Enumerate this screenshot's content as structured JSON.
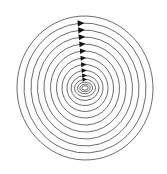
{
  "figure": {
    "name": "phase-portrait-center",
    "title": "Concentric closed orbits with clockwise flow arrows",
    "background_color": "#ffffff",
    "curve_color": "#3b3b3b",
    "arrow_color": "#111111",
    "width": 167,
    "height": 174
  },
  "chart_data": {
    "type": "line",
    "title": "Concentric closed orbits with clockwise flow arrows",
    "subtitle": "",
    "xlabel": "",
    "ylabel": "",
    "xlim": [
      0,
      167
    ],
    "ylim": [
      0,
      174
    ],
    "grid": false,
    "legend": "none",
    "axes_visible": false,
    "tick_labels_x": [],
    "tick_labels_y": [],
    "annotations": [],
    "center": {
      "x": 85,
      "y": 88
    },
    "orbit_count": 14,
    "arrow_count": 11,
    "arrow_direction": "right",
    "rotation_sense": "clockwise",
    "tilt_degrees": -4,
    "series": [
      {
        "name": "orbit-1",
        "rx": 68.0,
        "ry": 72.0,
        "arrow": true,
        "arrow_size": 0.0
      },
      {
        "name": "orbit-2",
        "rx": 61.0,
        "ry": 65.0,
        "arrow": true,
        "arrow_size": 5.0
      },
      {
        "name": "orbit-3",
        "rx": 54.0,
        "ry": 58.0,
        "arrow": true,
        "arrow_size": 5.0
      },
      {
        "name": "orbit-4",
        "rx": 47.5,
        "ry": 51.0,
        "arrow": true,
        "arrow_size": 4.8
      },
      {
        "name": "orbit-5",
        "rx": 41.0,
        "ry": 44.0,
        "arrow": true,
        "arrow_size": 4.6
      },
      {
        "name": "orbit-6",
        "rx": 34.5,
        "ry": 37.0,
        "arrow": true,
        "arrow_size": 4.4
      },
      {
        "name": "orbit-7",
        "rx": 28.5,
        "ry": 30.0,
        "arrow": true,
        "arrow_size": 4.2
      },
      {
        "name": "orbit-8",
        "rx": 23.0,
        "ry": 23.5,
        "arrow": true,
        "arrow_size": 4.0
      },
      {
        "name": "orbit-9",
        "rx": 18.0,
        "ry": 17.5,
        "arrow": true,
        "arrow_size": 3.8
      },
      {
        "name": "orbit-10",
        "rx": 14.0,
        "ry": 12.5,
        "arrow": true,
        "arrow_size": 3.6
      },
      {
        "name": "orbit-11",
        "rx": 10.5,
        "ry": 8.6,
        "arrow": true,
        "arrow_size": 3.4
      },
      {
        "name": "orbit-12",
        "rx": 7.6,
        "ry": 5.8,
        "arrow": false,
        "arrow_size": 0
      },
      {
        "name": "orbit-13",
        "rx": 5.2,
        "ry": 3.8,
        "arrow": false,
        "arrow_size": 0
      },
      {
        "name": "orbit-14",
        "rx": 3.2,
        "ry": 2.2,
        "arrow": false,
        "arrow_size": 0
      }
    ]
  }
}
